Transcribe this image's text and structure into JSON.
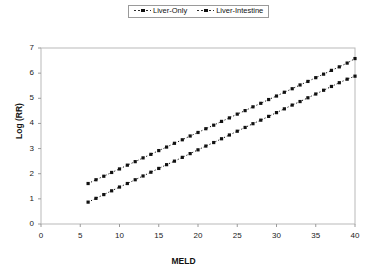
{
  "chart_data": {
    "type": "line",
    "title": "",
    "xlabel": "MELD",
    "ylabel": "Log (RR)",
    "xlim": [
      0,
      40
    ],
    "ylim": [
      0,
      7
    ],
    "xticks": [
      0,
      5,
      10,
      15,
      20,
      25,
      30,
      35,
      40
    ],
    "yticks": [
      0,
      1,
      2,
      3,
      4,
      5,
      6,
      7
    ],
    "grid": false,
    "legend_position": "top-center",
    "marker": "square",
    "line_style": "dotted",
    "series": [
      {
        "name": "Liver-Only",
        "color": "#111111",
        "x": [
          6,
          7,
          8,
          9,
          10,
          11,
          12,
          13,
          14,
          15,
          16,
          17,
          18,
          19,
          20,
          21,
          22,
          23,
          24,
          25,
          26,
          27,
          28,
          29,
          30,
          31,
          32,
          33,
          34,
          35,
          36,
          37,
          38,
          39,
          40
        ],
        "y": [
          0.87,
          1.02,
          1.17,
          1.32,
          1.47,
          1.61,
          1.76,
          1.91,
          2.06,
          2.21,
          2.36,
          2.5,
          2.65,
          2.8,
          2.95,
          3.1,
          3.24,
          3.39,
          3.54,
          3.69,
          3.84,
          3.99,
          4.13,
          4.28,
          4.43,
          4.58,
          4.73,
          4.87,
          5.02,
          5.17,
          5.32,
          5.47,
          5.62,
          5.76,
          5.88
        ]
      },
      {
        "name": "Liver-Intestine",
        "color": "#111111",
        "x": [
          6,
          7,
          8,
          9,
          10,
          11,
          12,
          13,
          14,
          15,
          16,
          17,
          18,
          19,
          20,
          21,
          22,
          23,
          24,
          25,
          26,
          27,
          28,
          29,
          30,
          31,
          32,
          33,
          34,
          35,
          36,
          37,
          38,
          39,
          40
        ],
        "y": [
          1.61,
          1.76,
          1.9,
          2.05,
          2.19,
          2.34,
          2.48,
          2.63,
          2.77,
          2.92,
          3.06,
          3.21,
          3.35,
          3.5,
          3.64,
          3.79,
          3.93,
          4.08,
          4.22,
          4.37,
          4.51,
          4.66,
          4.8,
          4.95,
          5.09,
          5.24,
          5.38,
          5.53,
          5.67,
          5.82,
          5.96,
          6.11,
          6.25,
          6.4,
          6.58
        ]
      }
    ]
  },
  "legend": {
    "items": [
      {
        "label": "Liver-Only"
      },
      {
        "label": "Liver-Intestine"
      }
    ]
  },
  "axes": {
    "y_title": "Log (RR)",
    "x_title": "MELD",
    "y_tick_labels": [
      "0",
      "1",
      "2",
      "3",
      "4",
      "5",
      "6",
      "7"
    ],
    "x_tick_labels": [
      "0",
      "5",
      "10",
      "15",
      "20",
      "25",
      "30",
      "35",
      "40"
    ]
  }
}
